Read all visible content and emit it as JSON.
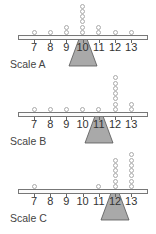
{
  "tick_labels": [
    "7",
    "8",
    "9",
    "10",
    "11",
    "12",
    "13"
  ],
  "colors": {
    "fulcrum_fill": "#a9a9a9",
    "fulcrum_stroke": "#555555",
    "beam_stroke": "#777777",
    "dot_stroke": "#aaaaaa"
  },
  "scales": [
    {
      "label": "Scale A",
      "fulcrum_at": "10",
      "counts": {
        "7": 1,
        "8": 1,
        "9": 2,
        "10": 6,
        "11": 2,
        "12": 1,
        "13": 1
      }
    },
    {
      "label": "Scale B",
      "fulcrum_at": "11",
      "counts": {
        "7": 1,
        "8": 1,
        "9": 1,
        "10": 1,
        "11": 1,
        "12": 7,
        "13": 2
      }
    },
    {
      "label": "Scale C",
      "fulcrum_at": "12",
      "counts": {
        "7": 1,
        "8": 0,
        "9": 0,
        "10": 0,
        "11": 1,
        "12": 6,
        "13": 7
      }
    }
  ]
}
